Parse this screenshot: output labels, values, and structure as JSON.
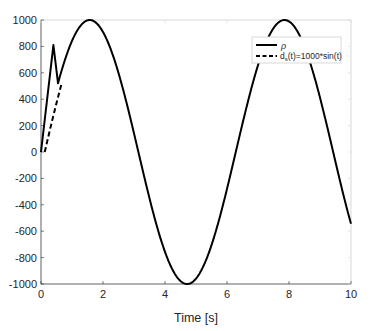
{
  "chart_data": {
    "type": "line",
    "title": "",
    "xlabel": "Time [s]",
    "ylabel": "",
    "xlim": [
      0,
      10
    ],
    "ylim": [
      -1000,
      1000
    ],
    "xticks": [
      0,
      2,
      4,
      6,
      8,
      10
    ],
    "yticks": [
      -1000,
      -800,
      -600,
      -400,
      -200,
      0,
      200,
      400,
      600,
      800,
      1000
    ],
    "grid": false,
    "legend_position": "northeast",
    "series": [
      {
        "name": "ρ",
        "style": "solid",
        "color": "#000000",
        "description": "Tracks 1000*sin(t) after initial transient; spikes to ~810 at t≈0.4 then drops to ~520 at t≈0.55 before following the sine",
        "x": [
          0,
          0.4,
          0.55,
          1.0,
          1.57,
          2.5,
          3.14,
          4.0,
          4.71,
          5.5,
          6.28,
          7.0,
          7.85,
          8.5,
          9.42,
          10
        ],
        "values": [
          0,
          810,
          520,
          841,
          1000,
          598,
          0,
          -757,
          -1000,
          -706,
          0,
          657,
          1000,
          798,
          0,
          -544
        ]
      },
      {
        "name": "d_s(t)=1000*sin(t)",
        "style": "dashed",
        "color": "#000000",
        "description": "Visible only during the initial transient (t from 0 to ~0.55); coincides with solid line afterwards",
        "x": [
          0,
          0.1,
          0.2,
          0.3,
          0.4,
          0.55
        ],
        "values": [
          0,
          100,
          199,
          296,
          389,
          523
        ]
      }
    ]
  },
  "legend": {
    "entries": [
      {
        "label": "ρ",
        "style": "solid"
      },
      {
        "label_main": "d",
        "label_sub": "s",
        "label_rest": "(t)=1000*sin(t)",
        "style": "dashed"
      }
    ]
  },
  "axes": {
    "xtick_labels": [
      "0",
      "2",
      "4",
      "6",
      "8",
      "10"
    ],
    "ytick_labels": [
      "-1000",
      "-800",
      "-600",
      "-400",
      "-200",
      "0",
      "200",
      "400",
      "600",
      "800",
      "1000"
    ],
    "xlabel": "Time [s]"
  },
  "colors": {
    "line": "#000000",
    "axes": "#262626",
    "box": "#d9d9d9",
    "background": "#ffffff"
  }
}
